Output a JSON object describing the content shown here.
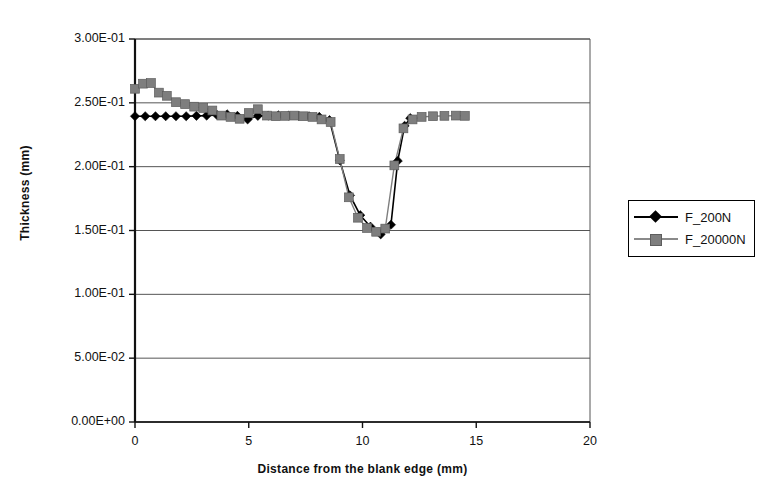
{
  "chart_data": {
    "type": "line",
    "title": "",
    "xlabel": "Distance from the blank edge (mm)",
    "ylabel": "Thickness (mm)",
    "xlim": [
      0,
      20
    ],
    "ylim": [
      0,
      0.3
    ],
    "xticks": [
      "0",
      "5",
      "10",
      "15",
      "20"
    ],
    "xtick_values": [
      0,
      5,
      10,
      15,
      20
    ],
    "yticks": [
      "0.00E+00",
      "5.00E-02",
      "1.00E-01",
      "1.50E-01",
      "2.00E-01",
      "2.50E-01",
      "3.00E-01"
    ],
    "ytick_values": [
      0,
      0.05,
      0.1,
      0.15,
      0.2,
      0.25,
      0.3
    ],
    "grid": "horizontal",
    "legend_position": "right",
    "series": [
      {
        "name": "F_200N",
        "color": "#000000",
        "marker": "diamond",
        "x": [
          0.0,
          0.45,
          0.9,
          1.35,
          1.8,
          2.25,
          2.7,
          3.15,
          3.6,
          4.05,
          4.5,
          4.95,
          5.4,
          5.85,
          6.3,
          6.75,
          7.2,
          7.65,
          8.1,
          8.55,
          9.0,
          9.45,
          9.9,
          10.35,
          10.8,
          11.25,
          11.55,
          11.85,
          12.1
        ],
        "y": [
          0.2395,
          0.2395,
          0.2395,
          0.2395,
          0.2395,
          0.2395,
          0.2398,
          0.24,
          0.2405,
          0.241,
          0.2398,
          0.237,
          0.2398,
          0.24,
          0.2402,
          0.24,
          0.2398,
          0.2395,
          0.239,
          0.2365,
          0.205,
          0.1775,
          0.162,
          0.153,
          0.147,
          0.1545,
          0.2045,
          0.232,
          0.238
        ]
      },
      {
        "name": "F_20000N",
        "color": "#7e7e7e",
        "marker": "square",
        "x": [
          0.0,
          0.35,
          0.7,
          1.05,
          1.4,
          1.8,
          2.2,
          2.6,
          3.0,
          3.4,
          3.8,
          4.2,
          4.6,
          5.0,
          5.4,
          5.8,
          6.2,
          6.6,
          7.0,
          7.4,
          7.8,
          8.2,
          8.6,
          9.0,
          9.4,
          9.8,
          10.2,
          10.6,
          11.0,
          11.4,
          11.8,
          12.2,
          12.6,
          13.1,
          13.6,
          14.1,
          14.5
        ],
        "y": [
          0.261,
          0.265,
          0.2655,
          0.258,
          0.2555,
          0.2505,
          0.249,
          0.247,
          0.246,
          0.244,
          0.24,
          0.239,
          0.2375,
          0.242,
          0.245,
          0.24,
          0.2395,
          0.2398,
          0.24,
          0.2395,
          0.239,
          0.237,
          0.235,
          0.206,
          0.176,
          0.16,
          0.152,
          0.149,
          0.1515,
          0.201,
          0.23,
          0.237,
          0.239,
          0.2395,
          0.2398,
          0.24,
          0.2398
        ]
      }
    ]
  },
  "legend": {
    "entries": [
      {
        "label": "F_200N"
      },
      {
        "label": "F_20000N"
      }
    ]
  }
}
